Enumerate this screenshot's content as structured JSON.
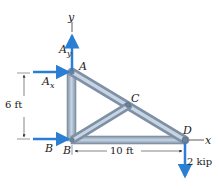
{
  "diagram": {
    "type": "truss free-body diagram",
    "joints": {
      "A": {
        "label": "A"
      },
      "B": {
        "label": "B"
      },
      "B_support": {
        "label": "B"
      },
      "C": {
        "label": "C"
      },
      "D": {
        "label": "D"
      }
    },
    "axes": {
      "x": "x",
      "y": "y"
    },
    "forces": {
      "Ay": {
        "label_main": "A",
        "label_sub": "y"
      },
      "Ax": {
        "label_main": "A",
        "label_sub": "x"
      },
      "load": {
        "label": "2 kip"
      }
    },
    "dimensions": {
      "height": "6 ft",
      "width": "10 ft"
    },
    "colors": {
      "arrow": "#2a7fd4",
      "member": "#9fb3c8",
      "member_edge": "#6d8197",
      "dim_line": "#333333"
    }
  }
}
